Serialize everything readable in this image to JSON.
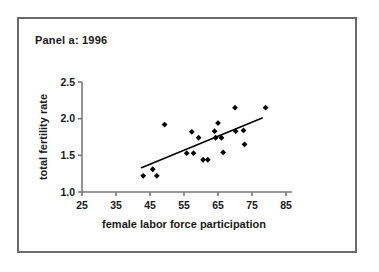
{
  "panel": {
    "title": "Panel a: 1996"
  },
  "chart_data": {
    "type": "scatter",
    "title": "Panel a: 1996",
    "xlabel": "female labor force participation",
    "ylabel": "total fertility rate",
    "xlim": [
      25,
      85
    ],
    "ylim": [
      1.0,
      2.5
    ],
    "xticks": [
      25,
      35,
      45,
      55,
      65,
      75,
      85
    ],
    "yticks": [
      "1.0",
      "1.5",
      "2.0",
      "2.5"
    ],
    "ytick_values": [
      1.0,
      1.5,
      2.0,
      2.5
    ],
    "grid": false,
    "legend": false,
    "marker": "diamond",
    "marker_color": "#000000",
    "points": [
      {
        "x": 43.0,
        "y": 1.22
      },
      {
        "x": 45.8,
        "y": 1.31
      },
      {
        "x": 47.0,
        "y": 1.22
      },
      {
        "x": 49.3,
        "y": 1.92
      },
      {
        "x": 55.8,
        "y": 1.53
      },
      {
        "x": 57.3,
        "y": 1.82
      },
      {
        "x": 57.8,
        "y": 1.53
      },
      {
        "x": 59.3,
        "y": 1.74
      },
      {
        "x": 60.6,
        "y": 1.44
      },
      {
        "x": 62.0,
        "y": 1.44
      },
      {
        "x": 64.0,
        "y": 1.83
      },
      {
        "x": 64.3,
        "y": 1.74
      },
      {
        "x": 65.0,
        "y": 1.94
      },
      {
        "x": 66.0,
        "y": 1.74
      },
      {
        "x": 66.5,
        "y": 1.54
      },
      {
        "x": 70.0,
        "y": 2.15
      },
      {
        "x": 70.2,
        "y": 1.83
      },
      {
        "x": 72.5,
        "y": 1.84
      },
      {
        "x": 72.8,
        "y": 1.65
      },
      {
        "x": 79.0,
        "y": 2.15
      }
    ],
    "trendline": {
      "type": "fit-line",
      "color": "#000000",
      "x_start": 42.5,
      "y_start": 1.33,
      "x_end": 78.0,
      "y_end": 2.01
    }
  }
}
